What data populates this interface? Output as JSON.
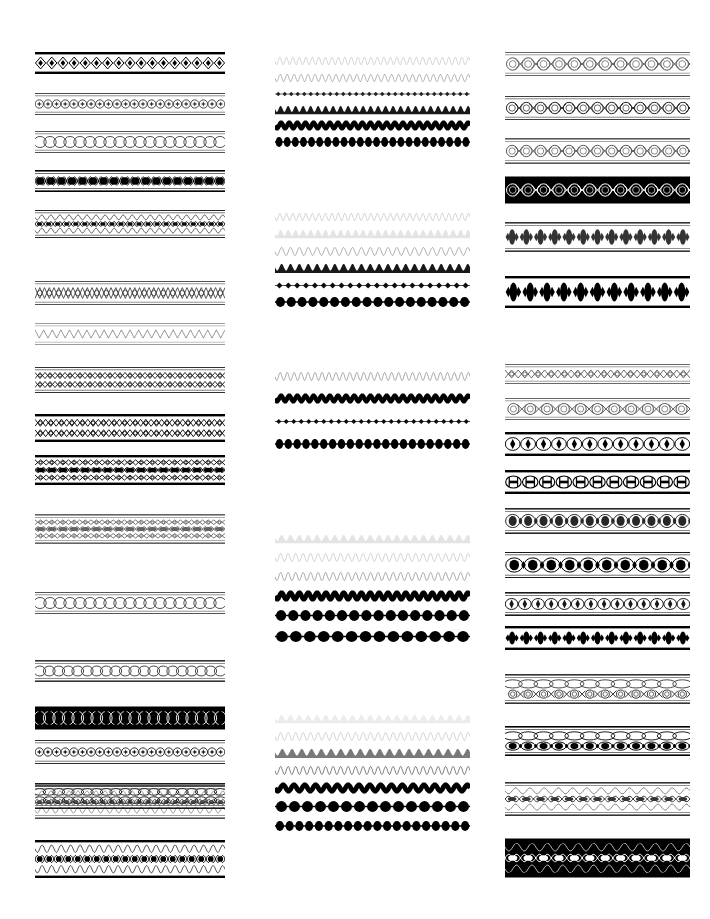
{
  "sheet": {
    "title": "Ornamental Border Rule Specimen Sheet",
    "width": 710,
    "height": 919,
    "background_color": "#ffffff",
    "ink_color": "#000000",
    "column_count": 3,
    "description": "A catalog sheet of decorative typographic border rules and ornamental dividers, printed black on white, arranged in three vertical columns."
  },
  "columns": [
    {
      "name": "column-left",
      "x": 35,
      "width": 190,
      "specimens": [
        {
          "name": "diamond-chain-heavy-band",
          "y": 52,
          "height": 22,
          "ink": "#000000",
          "motif": "diamond-chain",
          "rules": "heavy",
          "weight": "heavy",
          "density": 1.0,
          "repeat": 17,
          "bands": 1
        },
        {
          "name": "star-dot-light-band",
          "y": 93,
          "height": 22,
          "ink": "#111111",
          "motif": "star-dot",
          "rules": "thin",
          "weight": "light",
          "density": 0.85,
          "repeat": 22,
          "bands": 1
        },
        {
          "name": "oval-chain-open-band",
          "y": 131,
          "height": 22,
          "ink": "#111111",
          "motif": "oval-chain",
          "rules": "thin",
          "weight": "light",
          "density": 0.8,
          "repeat": 19,
          "bands": 1
        },
        {
          "name": "dot-lozenge-solid-band",
          "y": 170,
          "height": 22,
          "ink": "#000000",
          "motif": "dot-lozenge",
          "rules": "mixed",
          "weight": "heavy",
          "density": 1.0,
          "repeat": 18,
          "bands": 1
        },
        {
          "name": "triple-wave-dot-band",
          "y": 210,
          "height": 28,
          "ink": "#000000",
          "motif": "wave-dot",
          "rules": "thin",
          "weight": "medium",
          "density": 0.95,
          "repeat": 21,
          "bands": 3
        },
        {
          "name": "lattice-crosshatch-band",
          "y": 281,
          "height": 24,
          "ink": "#111111",
          "motif": "lattice",
          "rules": "thin",
          "weight": "medium",
          "density": 0.8,
          "repeat": 20,
          "bands": 1
        },
        {
          "name": "zigzag-faint-band",
          "y": 323,
          "height": 22,
          "ink": "#333333",
          "motif": "zigzag",
          "rules": "thin",
          "weight": "light",
          "density": 0.55,
          "repeat": 22,
          "bands": 1
        },
        {
          "name": "lattice-triple-band",
          "y": 367,
          "height": 26,
          "ink": "#000000",
          "motif": "lattice",
          "rules": "thin",
          "weight": "medium",
          "density": 0.9,
          "repeat": 19,
          "bands": 2
        },
        {
          "name": "diamond-lattice-heavy-band",
          "y": 414,
          "height": 28,
          "ink": "#000000",
          "motif": "lattice",
          "rules": "heavy",
          "weight": "heavy",
          "density": 1.0,
          "repeat": 18,
          "bands": 2
        },
        {
          "name": "lozenge-triple-heavy-band",
          "y": 455,
          "height": 30,
          "ink": "#000000",
          "motif": "dot-lozenge",
          "rules": "heavy",
          "weight": "heavy",
          "density": 1.0,
          "repeat": 17,
          "bands": 3
        },
        {
          "name": "lozenge-grey-band",
          "y": 514,
          "height": 30,
          "ink": "#222222",
          "motif": "dot-lozenge",
          "rules": "mixed",
          "weight": "medium",
          "density": 0.7,
          "repeat": 17,
          "bands": 3
        },
        {
          "name": "oval-chain-plain-band",
          "y": 592,
          "height": 22,
          "ink": "#111111",
          "motif": "oval-chain",
          "rules": "thin",
          "weight": "light",
          "density": 0.8,
          "repeat": 19,
          "bands": 1
        },
        {
          "name": "circle-chain-grey-band",
          "y": 660,
          "height": 22,
          "ink": "#111111",
          "motif": "oval-chain",
          "rules": "mixed",
          "weight": "medium",
          "density": 0.85,
          "repeat": 20,
          "bands": 1
        },
        {
          "name": "circle-chain-inverse-band",
          "y": 706,
          "height": 24,
          "ink": "#000000",
          "motif": "oval-chain",
          "rules": "heavy",
          "weight": "heavy",
          "density": 1.0,
          "repeat": 20,
          "bands": 1,
          "inverted": true
        },
        {
          "name": "star-circle-band",
          "y": 740,
          "height": 24,
          "ink": "#000000",
          "motif": "star-dot",
          "rules": "thin",
          "weight": "medium",
          "density": 0.9,
          "repeat": 22,
          "bands": 1
        },
        {
          "name": "circle-wave-triple-band",
          "y": 783,
          "height": 26,
          "ink": "#000000",
          "motif": "oval-chain",
          "rules": "mixed",
          "weight": "medium",
          "density": 0.9,
          "repeat": 20,
          "bands": 2
        },
        {
          "name": "wave-lozenge-grey-band",
          "y": 785,
          "height": 34,
          "ink": "#222222",
          "motif": "wave-dot",
          "rules": "mixed",
          "weight": "medium",
          "density": 0.8,
          "repeat": 21,
          "bands": 3
        },
        {
          "name": "wave-lozenge-solid-band",
          "y": 840,
          "height": 38,
          "ink": "#000000",
          "motif": "wave-dot",
          "rules": "heavy",
          "weight": "heavy",
          "density": 1.0,
          "repeat": 20,
          "bands": 3
        }
      ]
    },
    {
      "name": "column-middle",
      "x": 275,
      "width": 195,
      "specimens": [
        {
          "name": "wave-hairline-1",
          "y": 56,
          "height": 10,
          "ink": "#333333",
          "motif": "wave",
          "weight": "hairline",
          "density": 0.4,
          "repeat": 30,
          "bands": 0
        },
        {
          "name": "wave-thin-1",
          "y": 73,
          "height": 10,
          "ink": "#111111",
          "motif": "wave",
          "weight": "thin",
          "density": 0.6,
          "repeat": 28,
          "bands": 0
        },
        {
          "name": "diamond-row-small-1",
          "y": 89,
          "height": 10,
          "ink": "#000000",
          "motif": "diamond-row",
          "weight": "medium",
          "density": 0.85,
          "repeat": 30,
          "bands": 0
        },
        {
          "name": "wave-filled-1",
          "y": 105,
          "height": 10,
          "ink": "#000000",
          "motif": "wave-filled",
          "weight": "medium",
          "density": 0.9,
          "repeat": 26,
          "bands": 0
        },
        {
          "name": "wave-solid-1",
          "y": 120,
          "height": 11,
          "ink": "#000000",
          "motif": "wave-solid",
          "weight": "heavy",
          "density": 1.0,
          "repeat": 24,
          "bands": 0
        },
        {
          "name": "dot-row-heavy-1",
          "y": 136,
          "height": 12,
          "ink": "#000000",
          "motif": "dot-row",
          "weight": "heavy",
          "density": 1.0,
          "repeat": 24,
          "bands": 0
        },
        {
          "name": "wave-hairline-2",
          "y": 212,
          "height": 10,
          "ink": "#333333",
          "motif": "wave",
          "weight": "hairline",
          "density": 0.4,
          "repeat": 30,
          "bands": 0
        },
        {
          "name": "wave-faint-2",
          "y": 229,
          "height": 10,
          "ink": "#555555",
          "motif": "wave-filled",
          "weight": "hairline",
          "density": 0.35,
          "repeat": 26,
          "bands": 0
        },
        {
          "name": "wave-thin-2",
          "y": 246,
          "height": 11,
          "ink": "#111111",
          "motif": "wave",
          "weight": "thin",
          "density": 0.65,
          "repeat": 22,
          "bands": 0
        },
        {
          "name": "wave-filled-2",
          "y": 263,
          "height": 11,
          "ink": "#000000",
          "motif": "wave-filled",
          "weight": "medium",
          "density": 0.9,
          "repeat": 22,
          "bands": 0
        },
        {
          "name": "diamond-row-2",
          "y": 280,
          "height": 11,
          "ink": "#000000",
          "motif": "diamond-row",
          "weight": "medium",
          "density": 0.95,
          "repeat": 22,
          "bands": 0
        },
        {
          "name": "lozenge-row-heavy-2",
          "y": 296,
          "height": 12,
          "ink": "#000000",
          "motif": "dot-row",
          "weight": "heavy",
          "density": 1.0,
          "repeat": 18,
          "bands": 0
        },
        {
          "name": "wave-thin-3",
          "y": 371,
          "height": 11,
          "ink": "#111111",
          "motif": "wave",
          "weight": "thin",
          "density": 0.7,
          "repeat": 28,
          "bands": 0
        },
        {
          "name": "wave-solid-3",
          "y": 393,
          "height": 11,
          "ink": "#000000",
          "motif": "wave-solid",
          "weight": "heavy",
          "density": 1.0,
          "repeat": 24,
          "bands": 0
        },
        {
          "name": "diamond-row-3",
          "y": 416,
          "height": 11,
          "ink": "#000000",
          "motif": "diamond-row",
          "weight": "medium",
          "density": 0.95,
          "repeat": 26,
          "bands": 0
        },
        {
          "name": "dot-row-3",
          "y": 438,
          "height": 12,
          "ink": "#000000",
          "motif": "dot-row",
          "weight": "heavy",
          "density": 1.0,
          "repeat": 22,
          "bands": 0
        },
        {
          "name": "wave-faint-4",
          "y": 534,
          "height": 10,
          "ink": "#555555",
          "motif": "wave-filled",
          "weight": "hairline",
          "density": 0.35,
          "repeat": 22,
          "bands": 0
        },
        {
          "name": "wave-hairline-4",
          "y": 552,
          "height": 11,
          "ink": "#444444",
          "motif": "wave",
          "weight": "hairline",
          "density": 0.45,
          "repeat": 26,
          "bands": 0
        },
        {
          "name": "wave-thin-4",
          "y": 571,
          "height": 11,
          "ink": "#111111",
          "motif": "wave",
          "weight": "thin",
          "density": 0.7,
          "repeat": 26,
          "bands": 0
        },
        {
          "name": "wave-solid-4",
          "y": 590,
          "height": 12,
          "ink": "#000000",
          "motif": "wave-solid",
          "weight": "heavy",
          "density": 1.0,
          "repeat": 22,
          "bands": 0
        },
        {
          "name": "lozenge-row-4",
          "y": 609,
          "height": 13,
          "ink": "#000000",
          "motif": "dot-row",
          "weight": "heavy",
          "density": 1.0,
          "repeat": 16,
          "bands": 0
        },
        {
          "name": "lozenge-row-heavy-4",
          "y": 630,
          "height": 13,
          "ink": "#000000",
          "motif": "dot-row",
          "weight": "heavy",
          "density": 1.0,
          "repeat": 14,
          "bands": 0
        },
        {
          "name": "wave-faint-5",
          "y": 714,
          "height": 10,
          "ink": "#666666",
          "motif": "wave-filled",
          "weight": "hairline",
          "density": 0.3,
          "repeat": 22,
          "bands": 0
        },
        {
          "name": "wave-hairline-5",
          "y": 731,
          "height": 11,
          "ink": "#444444",
          "motif": "wave",
          "weight": "hairline",
          "density": 0.45,
          "repeat": 26,
          "bands": 0
        },
        {
          "name": "wave-thin-5",
          "y": 748,
          "height": 11,
          "ink": "#111111",
          "motif": "wave-filled",
          "weight": "thin",
          "density": 0.7,
          "repeat": 20,
          "bands": 0
        },
        {
          "name": "wave-medium-5",
          "y": 765,
          "height": 11,
          "ink": "#000000",
          "motif": "wave",
          "weight": "medium",
          "density": 0.85,
          "repeat": 26,
          "bands": 0
        },
        {
          "name": "wave-solid-5",
          "y": 782,
          "height": 12,
          "ink": "#000000",
          "motif": "wave-solid",
          "weight": "heavy",
          "density": 1.0,
          "repeat": 18,
          "bands": 0
        },
        {
          "name": "lozenge-row-5",
          "y": 800,
          "height": 13,
          "ink": "#000000",
          "motif": "dot-row",
          "weight": "heavy",
          "density": 1.0,
          "repeat": 15,
          "bands": 0
        },
        {
          "name": "lozenge-row-small-5",
          "y": 820,
          "height": 12,
          "ink": "#000000",
          "motif": "dot-row",
          "weight": "heavy",
          "density": 1.0,
          "repeat": 20,
          "bands": 0
        }
      ]
    },
    {
      "name": "column-right",
      "x": 505,
      "width": 185,
      "specimens": [
        {
          "name": "circle-chain-open-band",
          "y": 52,
          "height": 24,
          "ink": "#111111",
          "motif": "circle-chain",
          "rules": "thin",
          "weight": "light",
          "density": 0.7,
          "repeat": 12,
          "bands": 1
        },
        {
          "name": "circle-cross-chain-band",
          "y": 96,
          "height": 24,
          "ink": "#000000",
          "motif": "circle-chain",
          "rules": "thin",
          "weight": "medium",
          "density": 0.85,
          "repeat": 13,
          "bands": 1
        },
        {
          "name": "circle-chain-grey-band",
          "y": 138,
          "height": 26,
          "ink": "#222222",
          "motif": "circle-chain",
          "rules": "mixed",
          "weight": "medium",
          "density": 0.75,
          "repeat": 13,
          "bands": 1
        },
        {
          "name": "circle-chain-inverse-band",
          "y": 176,
          "height": 28,
          "ink": "#000000",
          "motif": "circle-chain",
          "rules": "heavy",
          "weight": "heavy",
          "density": 1.0,
          "repeat": 12,
          "bands": 1,
          "inverted": true
        },
        {
          "name": "lozenge-cluster-grey-band",
          "y": 222,
          "height": 30,
          "ink": "#111111",
          "motif": "lozenge-cluster",
          "rules": "mixed",
          "weight": "medium",
          "density": 0.85,
          "repeat": 13,
          "bands": 1
        },
        {
          "name": "lozenge-cluster-heavy-band",
          "y": 276,
          "height": 32,
          "ink": "#000000",
          "motif": "lozenge-cluster",
          "rules": "heavy",
          "weight": "heavy",
          "density": 1.0,
          "repeat": 11,
          "bands": 1
        },
        {
          "name": "cross-lattice-thin-band",
          "y": 364,
          "height": 20,
          "ink": "#111111",
          "motif": "lattice",
          "rules": "thin",
          "weight": "light",
          "density": 0.7,
          "repeat": 14,
          "bands": 0
        },
        {
          "name": "circle-chain-wide-band",
          "y": 398,
          "height": 22,
          "ink": "#111111",
          "motif": "circle-chain",
          "rules": "thin",
          "weight": "light",
          "density": 0.7,
          "repeat": 11,
          "bands": 1
        },
        {
          "name": "diamond-eye-band",
          "y": 432,
          "height": 24,
          "ink": "#000000",
          "motif": "diamond-eye",
          "rules": "heavy",
          "weight": "heavy",
          "density": 1.0,
          "repeat": 12,
          "bands": 1
        },
        {
          "name": "barbell-chain-band",
          "y": 470,
          "height": 24,
          "ink": "#000000",
          "motif": "barbell",
          "rules": "heavy",
          "weight": "heavy",
          "density": 1.0,
          "repeat": 11,
          "bands": 1
        },
        {
          "name": "oval-dot-grey-band",
          "y": 508,
          "height": 26,
          "ink": "#111111",
          "motif": "oval-dot",
          "rules": "mixed",
          "weight": "medium",
          "density": 0.9,
          "repeat": 12,
          "bands": 1
        },
        {
          "name": "oval-dot-large-band",
          "y": 552,
          "height": 26,
          "ink": "#000000",
          "motif": "oval-dot",
          "rules": "thin",
          "weight": "heavy",
          "density": 1.0,
          "repeat": 10,
          "bands": 1
        },
        {
          "name": "small-diamond-chain-band",
          "y": 592,
          "height": 24,
          "ink": "#000000",
          "motif": "diamond-eye",
          "rules": "mixed",
          "weight": "medium",
          "density": 0.9,
          "repeat": 14,
          "bands": 1
        },
        {
          "name": "dot-cluster-chain-band",
          "y": 626,
          "height": 24,
          "ink": "#000000",
          "motif": "lozenge-cluster",
          "rules": "heavy",
          "weight": "heavy",
          "density": 1.0,
          "repeat": 13,
          "bands": 1
        },
        {
          "name": "oval-chain-triple-grey-band",
          "y": 674,
          "height": 30,
          "ink": "#111111",
          "motif": "circle-chain",
          "rules": "mixed",
          "weight": "medium",
          "density": 0.85,
          "repeat": 12,
          "bands": 2
        },
        {
          "name": "circle-dot-triple-band",
          "y": 726,
          "height": 30,
          "ink": "#000000",
          "motif": "oval-dot",
          "rules": "mixed",
          "weight": "heavy",
          "density": 1.0,
          "repeat": 12,
          "bands": 2
        },
        {
          "name": "wave-oval-grey-band",
          "y": 782,
          "height": 34,
          "ink": "#111111",
          "motif": "wave-dot",
          "rules": "mixed",
          "weight": "medium",
          "density": 0.85,
          "repeat": 13,
          "bands": 3
        },
        {
          "name": "wave-oval-inverse-band",
          "y": 838,
          "height": 40,
          "ink": "#000000",
          "motif": "wave-dot",
          "rules": "heavy",
          "weight": "heavy",
          "density": 1.0,
          "repeat": 12,
          "bands": 3,
          "inverted": true
        }
      ]
    }
  ]
}
